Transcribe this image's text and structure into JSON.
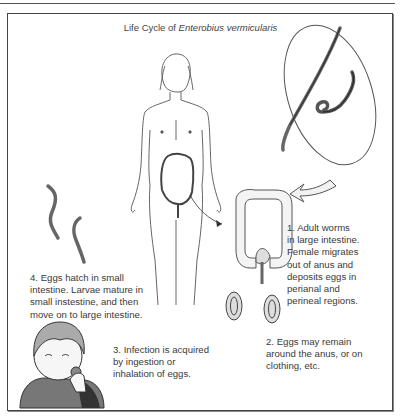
{
  "title": {
    "prefix": "Life Cycle of ",
    "species": "Enterobius vermicularis"
  },
  "steps": [
    {
      "id": 1,
      "lines": [
        "1. Adult worms",
        "in large intestine.",
        "Female migrates",
        "out of anus and",
        "deposits eggs in",
        "perianal and",
        "perineal regions."
      ]
    },
    {
      "id": 2,
      "lines": [
        "2. Eggs may remain",
        "around the anus, or on",
        "clothing, etc."
      ]
    },
    {
      "id": 3,
      "lines": [
        "3. Infection is acquired",
        "by ingestion or",
        "inhalation of eggs."
      ]
    },
    {
      "id": 4,
      "lines": [
        "4. Eggs hatch in small",
        "intestine. Larvae mature in",
        "small instestine, and then",
        "move on to large intestine."
      ]
    }
  ],
  "illustrations": {
    "human_figure": "female-body-with-intestine",
    "magnified_worms": "adult-worms-oval-inset",
    "large_intestine": "colon-detail",
    "eggs": "two-eggs",
    "larvae": "two-larvae",
    "child": "child-hand-to-mouth"
  }
}
